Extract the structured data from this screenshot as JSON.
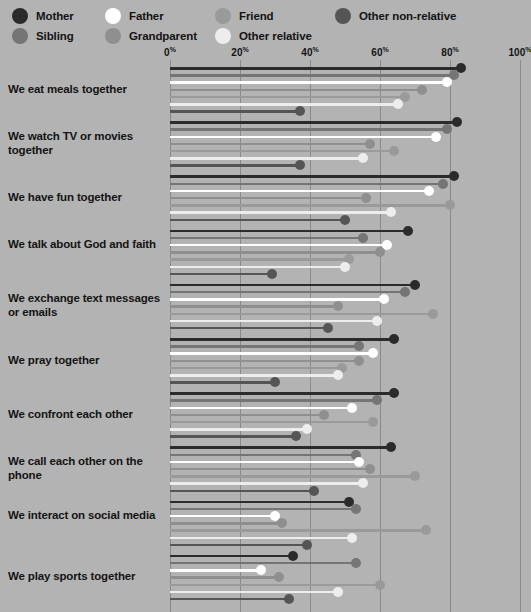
{
  "legend": {
    "items": [
      {
        "label": "Mother",
        "color": "#2b2b2b",
        "col": 0,
        "row": 0
      },
      {
        "label": "Sibling",
        "color": "#757575",
        "col": 0,
        "row": 1
      },
      {
        "label": "Father",
        "color": "#ffffff",
        "col": 1,
        "row": 0
      },
      {
        "label": "Grandparent",
        "color": "#8f8f8f",
        "col": 1,
        "row": 1
      },
      {
        "label": "Friend",
        "color": "#9a9a9a",
        "col": 2,
        "row": 0
      },
      {
        "label": "Other relative",
        "color": "#ededed",
        "col": 2,
        "row": 1
      },
      {
        "label": "Other non-relative",
        "color": "#555555",
        "col": 3,
        "row": 0
      }
    ]
  },
  "chart_data": {
    "type": "bar",
    "title": "",
    "xlabel": "",
    "ylabel": "",
    "xlim": [
      0,
      100
    ],
    "grid": true,
    "legend_position": "top",
    "tick_labels": [
      "0%",
      "20%",
      "40%",
      "60%",
      "80%",
      "100%"
    ],
    "ticks": [
      0,
      20,
      40,
      60,
      80,
      100
    ],
    "categories": [
      "We eat meals together",
      "We watch TV or movies together",
      "We have fun together",
      "We talk about God and faith",
      "We exchange text messages or emails",
      "We pray together",
      "We confront each other",
      "We call each other on the phone",
      "We interact on social media",
      "We play sports together"
    ],
    "series": [
      {
        "name": "Mother",
        "color": "#2b2b2b",
        "values": [
          83,
          82,
          81,
          68,
          70,
          64,
          64,
          63,
          51,
          35
        ]
      },
      {
        "name": "Sibling",
        "color": "#757575",
        "values": [
          81,
          79,
          78,
          55,
          67,
          54,
          59,
          53,
          53,
          53
        ]
      },
      {
        "name": "Father",
        "color": "#ffffff",
        "values": [
          79,
          76,
          74,
          62,
          61,
          58,
          52,
          54,
          30,
          26
        ]
      },
      {
        "name": "Grandparent",
        "color": "#8f8f8f",
        "values": [
          72,
          57,
          56,
          60,
          48,
          54,
          44,
          57,
          32,
          31
        ]
      },
      {
        "name": "Friend",
        "color": "#9a9a9a",
        "values": [
          67,
          64,
          80,
          51,
          75,
          49,
          58,
          70,
          73,
          60
        ]
      },
      {
        "name": "Other relative",
        "color": "#ededed",
        "values": [
          65,
          55,
          63,
          50,
          59,
          48,
          39,
          55,
          52,
          48
        ]
      },
      {
        "name": "Other non-relative",
        "color": "#555555",
        "values": [
          37,
          37,
          50,
          29,
          45,
          30,
          36,
          41,
          39,
          34
        ]
      }
    ]
  }
}
